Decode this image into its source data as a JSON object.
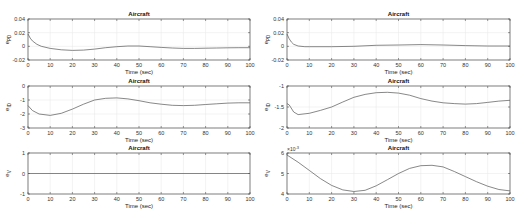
{
  "chart_data": [
    {
      "type": "line",
      "title": "Aircraft",
      "xlabel": "Time (sec)",
      "ylabel": "e_PD",
      "xlim": [
        0,
        100
      ],
      "ylim": [
        -0.02,
        0.04
      ],
      "yticks": [
        "-0.02",
        "0",
        "0.02",
        "0.04"
      ],
      "xticks": [
        "0",
        "10",
        "20",
        "30",
        "40",
        "50",
        "60",
        "70",
        "80",
        "90",
        "100"
      ],
      "grid": true,
      "x": [
        0,
        1,
        2,
        4,
        6,
        10,
        15,
        20,
        25,
        30,
        35,
        40,
        45,
        50,
        55,
        60,
        65,
        70,
        75,
        80,
        85,
        90,
        95,
        100
      ],
      "y": [
        0.018,
        0.012,
        0.008,
        0.003,
        0.0,
        -0.003,
        -0.005,
        -0.006,
        -0.0055,
        -0.004,
        -0.002,
        -0.0005,
        0.0005,
        0.0005,
        -0.0005,
        -0.0015,
        -0.0025,
        -0.003,
        -0.003,
        -0.0028,
        -0.0025,
        -0.0022,
        -0.002,
        -0.002
      ]
    },
    {
      "type": "line",
      "title": "Aircraft",
      "xlabel": "Time (sec)",
      "ylabel": "e_ID",
      "xlim": [
        0,
        100
      ],
      "ylim": [
        -3,
        0
      ],
      "yticks": [
        "-3",
        "-2",
        "-1",
        "0"
      ],
      "xticks": [
        "0",
        "10",
        "20",
        "30",
        "40",
        "50",
        "60",
        "70",
        "80",
        "90",
        "100"
      ],
      "grid": true,
      "x": [
        0,
        2,
        5,
        10,
        15,
        20,
        25,
        30,
        35,
        40,
        45,
        50,
        55,
        60,
        65,
        70,
        75,
        80,
        85,
        90,
        95,
        100
      ],
      "y": [
        -1.4,
        -1.75,
        -2.0,
        -2.1,
        -1.95,
        -1.65,
        -1.3,
        -1.0,
        -0.88,
        -0.85,
        -0.92,
        -1.05,
        -1.2,
        -1.3,
        -1.38,
        -1.4,
        -1.38,
        -1.32,
        -1.27,
        -1.22,
        -1.2,
        -1.2
      ]
    },
    {
      "type": "line",
      "title": "Aircraft",
      "xlabel": "Time (sec)",
      "ylabel": "e_V",
      "xlim": [
        0,
        100
      ],
      "ylim": [
        -1,
        1
      ],
      "yticks": [
        "-1",
        "0",
        "1"
      ],
      "xticks": [
        "0",
        "10",
        "20",
        "30",
        "40",
        "50",
        "60",
        "70",
        "80",
        "90",
        "100"
      ],
      "grid": true,
      "x": [
        0,
        100
      ],
      "y": [
        0,
        0
      ]
    },
    {
      "type": "line",
      "title": "Aircraft",
      "xlabel": "Time (sec)",
      "ylabel": "e_PD",
      "xlim": [
        0,
        100
      ],
      "ylim": [
        -0.02,
        0.04
      ],
      "yticks": [
        "-0.02",
        "0",
        "0.02",
        "0.04"
      ],
      "xticks": [
        "0",
        "10",
        "20",
        "30",
        "40",
        "50",
        "60",
        "70",
        "80",
        "90",
        "100"
      ],
      "grid": true,
      "x": [
        0,
        1,
        2,
        3,
        5,
        8,
        10,
        20,
        30,
        40,
        50,
        60,
        70,
        80,
        90,
        100
      ],
      "y": [
        0.018,
        0.011,
        0.006,
        0.003,
        0.0005,
        -0.0005,
        -0.0005,
        -0.0005,
        0.0,
        0.0015,
        0.002,
        0.0025,
        0.002,
        0.001,
        0.0005,
        0.0005
      ]
    },
    {
      "type": "line",
      "title": "Aircraft",
      "xlabel": "Time (sec)",
      "ylabel": "e_ID",
      "xlim": [
        0,
        100
      ],
      "ylim": [
        -2,
        -1
      ],
      "yticks": [
        "-2",
        "-1.5",
        "-1"
      ],
      "xticks": [
        "0",
        "10",
        "20",
        "30",
        "40",
        "50",
        "60",
        "70",
        "80",
        "90",
        "100"
      ],
      "grid": true,
      "x": [
        0,
        1,
        3,
        5,
        10,
        15,
        20,
        25,
        30,
        35,
        40,
        45,
        50,
        55,
        60,
        65,
        70,
        75,
        80,
        85,
        90,
        95,
        100
      ],
      "y": [
        -1.42,
        -1.45,
        -1.62,
        -1.68,
        -1.65,
        -1.58,
        -1.5,
        -1.38,
        -1.27,
        -1.2,
        -1.16,
        -1.15,
        -1.17,
        -1.22,
        -1.3,
        -1.36,
        -1.4,
        -1.42,
        -1.43,
        -1.42,
        -1.39,
        -1.36,
        -1.34
      ]
    },
    {
      "type": "line",
      "title": "Aircraft",
      "xlabel": "Time (sec)",
      "ylabel": "e_V",
      "ylabel_exponent": "x 10^-3",
      "xlim": [
        0,
        100
      ],
      "ylim": [
        4,
        6
      ],
      "yticks": [
        "4",
        "5",
        "6"
      ],
      "xticks": [
        "0",
        "10",
        "20",
        "30",
        "40",
        "50",
        "60",
        "70",
        "80",
        "90",
        "100"
      ],
      "grid": true,
      "x": [
        0,
        5,
        10,
        15,
        20,
        25,
        30,
        35,
        40,
        45,
        50,
        55,
        60,
        65,
        70,
        75,
        80,
        85,
        90,
        95,
        100
      ],
      "y": [
        5.9,
        5.55,
        5.15,
        4.75,
        4.42,
        4.2,
        4.12,
        4.18,
        4.4,
        4.7,
        5.0,
        5.25,
        5.38,
        5.4,
        5.32,
        5.1,
        4.85,
        4.6,
        4.38,
        4.22,
        4.15
      ]
    }
  ],
  "labels": {
    "title": "Aircraft",
    "xlabel": "Time (sec)",
    "exponent": "×10",
    "exponent_power": "-3"
  }
}
